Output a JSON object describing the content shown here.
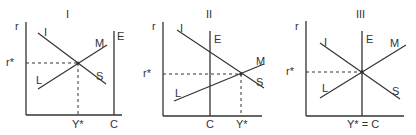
{
  "panels": [
    {
      "title": "I",
      "y_axis_label": "r",
      "equilibrium_r_label": "r*",
      "x_labels": [
        "Y*",
        "C"
      ],
      "curve_labels": {
        "is_top": "I",
        "is_bottom": "S",
        "lm_top": "M",
        "lm_bottom": "L",
        "vertical": "E"
      }
    },
    {
      "title": "II",
      "y_axis_label": "r",
      "equilibrium_r_label": "r*",
      "x_labels": [
        "C",
        "Y*"
      ],
      "curve_labels": {
        "is_top": "I",
        "is_bottom": "S",
        "lm_top": "M",
        "lm_bottom": "L",
        "vertical": "E"
      }
    },
    {
      "title": "III",
      "y_axis_label": "r",
      "equilibrium_r_label": "r*",
      "x_labels": [
        "Y* = C"
      ],
      "curve_labels": {
        "is_top": "I",
        "is_bottom": "S",
        "lm_top": "M",
        "lm_bottom": "L",
        "vertical": "E"
      }
    }
  ]
}
